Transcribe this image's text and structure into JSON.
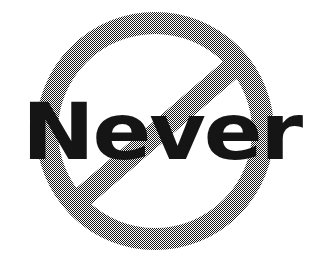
{
  "image": {
    "title": "Never prohibition sign",
    "width": 315,
    "height": 267,
    "background_color": "#ffffff"
  },
  "sign": {
    "type": "prohibition-sign",
    "name": "no-entry-circle-slash",
    "stroke_color": "#808080",
    "halftone": "dithered gray halftone dot pattern",
    "circle": {
      "center_x": 155,
      "center_y": 131,
      "outer_radius": 119,
      "stroke_width": 22
    },
    "slash": {
      "orientation": "upper-right to lower-left",
      "start_x": 245,
      "start_y": 57,
      "end_x": 70,
      "end_y": 208,
      "stroke_width": 22
    }
  },
  "word": {
    "text": "Never",
    "color": "#151515",
    "weight": "bold",
    "left": 22,
    "baseline_y": 159,
    "cap_top_y": 103,
    "right": 301
  }
}
